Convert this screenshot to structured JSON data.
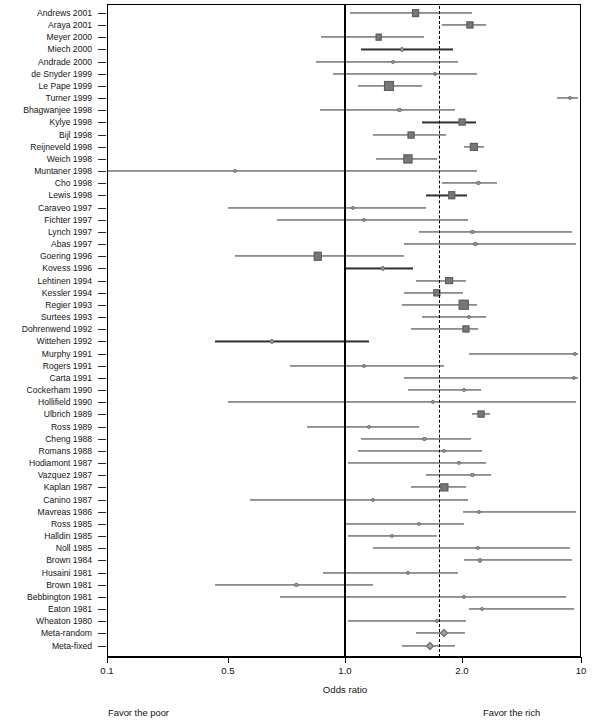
{
  "chart_data": {
    "type": "forest",
    "title": "",
    "xlabel": "Odds ratio",
    "ylabel": "",
    "scale": "piecewise-log",
    "grid": false,
    "legend_position": "none",
    "xticks": [
      0.1,
      0.5,
      1.0,
      2.0,
      10
    ],
    "xtick_labels": [
      "0.1",
      "0.5",
      "1.0",
      "2.0",
      "10"
    ],
    "xlim": [
      0.1,
      10
    ],
    "reference_line_null": 1.0,
    "reference_line_pooled": 1.75,
    "annotations": {
      "left": "Favor the poor",
      "right": "Favor the rich"
    },
    "categories": [
      "Andrews 2001",
      "Araya 2001",
      "Meyer 2000",
      "Miech 2000",
      "Andrade 2000",
      "de Snyder 1999",
      "Le Pape 1999",
      "Turner 1999",
      "Bhagwanjee 1998",
      "Kylye 1998",
      "Bijl 1998",
      "Reijneveld 1998",
      "Weich 1998",
      "Muntaner 1998",
      "Cho 1998",
      "Lewis 1998",
      "Caraveo 1997",
      "Fichter 1997",
      "Lynch 1997",
      "Abas 1997",
      "Goering 1996",
      "Kovess 1996",
      "Lehtinen 1994",
      "Kessler 1994",
      "Regier 1993",
      "Surtees 1993",
      "Dohrenwend 1992",
      "Wittehen 1992",
      "Murphy 1991",
      "Rogers 1991",
      "Carta 1991",
      "Cockerham 1990",
      "Hollifield 1990",
      "Ulbrich 1989",
      "Ross 1989",
      "Cheng 1988",
      "Romans 1988",
      "Hodiamont 1987",
      "Vazquez 1987",
      "Kaplan 1987",
      "Canino 1987",
      "Mavreas 1986",
      "Ross 1985",
      "Halldin 1985",
      "Noll 1985",
      "Brown 1984",
      "Husaini 1981",
      "Brown 1981",
      "Bebbington 1981",
      "Eaton 1981",
      "Wheaton 1980",
      "Meta-random",
      "Meta-fixed"
    ],
    "studies": [
      {
        "label": "Andrews 2001",
        "or": 1.52,
        "lo": 1.03,
        "hi": 2.28,
        "weight": 4.0,
        "marker": "square"
      },
      {
        "label": "Araya 2001",
        "or": 2.22,
        "lo": 1.78,
        "hi": 2.76,
        "weight": 3.4,
        "marker": "square"
      },
      {
        "label": "Meyer 2000",
        "or": 1.22,
        "lo": 0.87,
        "hi": 1.6,
        "weight": 3.0,
        "marker": "square"
      },
      {
        "label": "Miech 2000",
        "or": 1.4,
        "lo": 1.1,
        "hi": 1.9,
        "weight": 2.0,
        "marker": "dot"
      },
      {
        "label": "Andrade 2000",
        "or": 1.33,
        "lo": 0.84,
        "hi": 1.95,
        "weight": 1.6,
        "marker": "dot"
      },
      {
        "label": "de Snyder 1999",
        "or": 1.7,
        "lo": 0.93,
        "hi": 2.45,
        "weight": 1.6,
        "marker": "dot"
      },
      {
        "label": "Le Pape 1999",
        "or": 1.3,
        "lo": 1.08,
        "hi": 1.58,
        "weight": 6.0,
        "marker": "square"
      },
      {
        "label": "Turner 1999",
        "or": 8.6,
        "lo": 7.2,
        "hi": 9.6,
        "weight": 2.0,
        "marker": "dot"
      },
      {
        "label": "Bhagwanjee 1998",
        "or": 1.38,
        "lo": 0.86,
        "hi": 1.92,
        "weight": 1.6,
        "marker": "dot"
      },
      {
        "label": "Kylye 1998",
        "or": 2.0,
        "lo": 1.58,
        "hi": 2.42,
        "weight": 3.2,
        "marker": "square"
      },
      {
        "label": "Bijl 1998",
        "or": 1.48,
        "lo": 1.18,
        "hi": 1.82,
        "weight": 3.2,
        "marker": "square"
      },
      {
        "label": "Reijneveld 1998",
        "or": 2.35,
        "lo": 2.05,
        "hi": 2.68,
        "weight": 4.4,
        "marker": "square"
      },
      {
        "label": "Weich 1998",
        "or": 1.45,
        "lo": 1.2,
        "hi": 1.72,
        "weight": 5.2,
        "marker": "square"
      },
      {
        "label": "Muntaner 1998",
        "or": 0.52,
        "lo": 0.1,
        "hi": 2.45,
        "weight": 1.6,
        "marker": "dot"
      },
      {
        "label": "Cho 1998",
        "or": 2.5,
        "lo": 1.78,
        "hi": 3.2,
        "weight": 2.0,
        "marker": "dot"
      },
      {
        "label": "Lewis 1998",
        "or": 1.88,
        "lo": 1.62,
        "hi": 2.15,
        "weight": 3.8,
        "marker": "square"
      },
      {
        "label": "Caraveo 1997",
        "or": 1.05,
        "lo": 0.5,
        "hi": 1.62,
        "weight": 1.6,
        "marker": "dot"
      },
      {
        "label": "Fichter 1997",
        "or": 1.12,
        "lo": 0.67,
        "hi": 2.18,
        "weight": 1.6,
        "marker": "dot"
      },
      {
        "label": "Lynch 1997",
        "or": 2.3,
        "lo": 1.55,
        "hi": 8.8,
        "weight": 1.6,
        "marker": "dot"
      },
      {
        "label": "Abas 1997",
        "or": 2.4,
        "lo": 1.42,
        "hi": 9.4,
        "weight": 1.6,
        "marker": "dot"
      },
      {
        "label": "Goering 1996",
        "or": 0.85,
        "lo": 0.52,
        "hi": 1.42,
        "weight": 4.6,
        "marker": "square"
      },
      {
        "label": "Kovess 1996",
        "or": 1.25,
        "lo": 1.0,
        "hi": 1.5,
        "weight": 2.0,
        "marker": "dot"
      },
      {
        "label": "Lehtinen 1994",
        "or": 1.85,
        "lo": 1.52,
        "hi": 2.12,
        "weight": 4.0,
        "marker": "square"
      },
      {
        "label": "Kessler 1994",
        "or": 1.72,
        "lo": 1.42,
        "hi": 2.02,
        "weight": 3.6,
        "marker": "square"
      },
      {
        "label": "Regier 1993",
        "or": 2.05,
        "lo": 1.4,
        "hi": 2.45,
        "weight": 6.4,
        "marker": "square"
      },
      {
        "label": "Surtees 1993",
        "or": 2.2,
        "lo": 1.58,
        "hi": 2.75,
        "weight": 2.0,
        "marker": "dot"
      },
      {
        "label": "Dohrenwend 1992",
        "or": 2.1,
        "lo": 1.48,
        "hi": 2.5,
        "weight": 3.4,
        "marker": "square"
      },
      {
        "label": "Wittehen 1992",
        "or": 0.65,
        "lo": 0.42,
        "hi": 1.15,
        "weight": 2.0,
        "marker": "dot"
      },
      {
        "label": "Murphy 1991",
        "or": 9.2,
        "lo": 2.2,
        "hi": 9.6,
        "weight": 2.0,
        "marker": "dot"
      },
      {
        "label": "Rogers 1991",
        "or": 1.12,
        "lo": 0.72,
        "hi": 1.8,
        "weight": 2.0,
        "marker": "dot"
      },
      {
        "label": "Carta 1991",
        "or": 9.1,
        "lo": 1.42,
        "hi": 9.55,
        "weight": 2.0,
        "marker": "dot"
      },
      {
        "label": "Cockerham 1990",
        "or": 2.05,
        "lo": 1.45,
        "hi": 2.58,
        "weight": 2.0,
        "marker": "dot"
      },
      {
        "label": "Hollifield 1990",
        "or": 1.68,
        "lo": 0.5,
        "hi": 9.3,
        "weight": 1.6,
        "marker": "dot"
      },
      {
        "label": "Ulbrich 1989",
        "or": 2.6,
        "lo": 2.28,
        "hi": 2.92,
        "weight": 3.2,
        "marker": "square"
      },
      {
        "label": "Ross 1989",
        "or": 1.15,
        "lo": 0.8,
        "hi": 1.55,
        "weight": 2.0,
        "marker": "dot"
      },
      {
        "label": "Cheng 1988",
        "or": 1.6,
        "lo": 1.1,
        "hi": 2.25,
        "weight": 2.0,
        "marker": "dot"
      },
      {
        "label": "Romans 1988",
        "or": 1.8,
        "lo": 1.08,
        "hi": 2.62,
        "weight": 2.0,
        "marker": "dot"
      },
      {
        "label": "Hodiamont 1987",
        "or": 1.96,
        "lo": 1.02,
        "hi": 2.78,
        "weight": 2.4,
        "marker": "dot"
      },
      {
        "label": "Vazquez 1987",
        "or": 2.3,
        "lo": 1.62,
        "hi": 2.95,
        "weight": 2.0,
        "marker": "dot"
      },
      {
        "label": "Kaplan 1987",
        "or": 1.8,
        "lo": 1.48,
        "hi": 2.12,
        "weight": 3.6,
        "marker": "square"
      },
      {
        "label": "Canino 1987",
        "or": 1.18,
        "lo": 0.57,
        "hi": 2.18,
        "weight": 2.0,
        "marker": "dot"
      },
      {
        "label": "Mavreas 1986",
        "or": 2.52,
        "lo": 2.02,
        "hi": 9.3,
        "weight": 2.0,
        "marker": "dot"
      },
      {
        "label": "Ross 1985",
        "or": 1.55,
        "lo": 1.0,
        "hi": 2.05,
        "weight": 2.0,
        "marker": "dot"
      },
      {
        "label": "Halldin 1985",
        "or": 1.32,
        "lo": 1.02,
        "hi": 1.72,
        "weight": 2.0,
        "marker": "dot"
      },
      {
        "label": "Noll 1985",
        "or": 2.48,
        "lo": 1.18,
        "hi": 8.6,
        "weight": 2.0,
        "marker": "dot"
      },
      {
        "label": "Brown 1984",
        "or": 2.55,
        "lo": 2.05,
        "hi": 8.9,
        "weight": 2.4,
        "marker": "dot"
      },
      {
        "label": "Husaini 1981",
        "or": 1.45,
        "lo": 0.88,
        "hi": 1.95,
        "weight": 2.0,
        "marker": "dot"
      },
      {
        "label": "Brown 1981",
        "or": 0.75,
        "lo": 0.42,
        "hi": 1.18,
        "weight": 2.0,
        "marker": "dot"
      },
      {
        "label": "Bebbington 1981",
        "or": 2.05,
        "lo": 0.68,
        "hi": 8.2,
        "weight": 2.0,
        "marker": "dot"
      },
      {
        "label": "Eaton 1981",
        "or": 2.62,
        "lo": 2.2,
        "hi": 9.05,
        "weight": 2.0,
        "marker": "dot"
      },
      {
        "label": "Wheaton 1980",
        "or": 1.72,
        "lo": 1.02,
        "hi": 2.12,
        "weight": 2.0,
        "marker": "dot"
      },
      {
        "label": "Meta-random",
        "or": 1.8,
        "lo": 1.52,
        "hi": 2.08,
        "weight": 0,
        "marker": "diamond"
      },
      {
        "label": "Meta-fixed",
        "or": 1.65,
        "lo": 1.4,
        "hi": 1.92,
        "weight": 0,
        "marker": "diamond"
      }
    ]
  }
}
